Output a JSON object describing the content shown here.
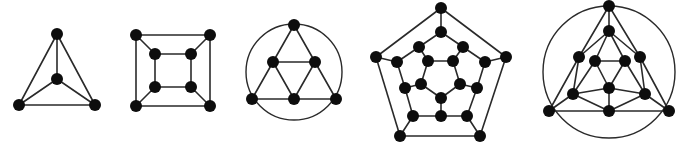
{
  "figure": {
    "node_color": "#0d0d0d",
    "edge_color": "#2a2a2a",
    "node_radius": 6
  },
  "graphs": [
    {
      "name": "tetrahedron",
      "nodes": [
        [
          57,
          34
        ],
        [
          57,
          79
        ],
        [
          19,
          105
        ],
        [
          95,
          105
        ]
      ],
      "edges": [
        [
          0,
          1
        ],
        [
          0,
          2
        ],
        [
          0,
          3
        ],
        [
          1,
          2
        ],
        [
          1,
          3
        ],
        [
          2,
          3
        ]
      ],
      "circles": []
    },
    {
      "name": "cube",
      "nodes": [
        [
          136,
          35
        ],
        [
          210,
          35
        ],
        [
          136,
          106
        ],
        [
          210,
          106
        ],
        [
          155,
          54
        ],
        [
          191,
          54
        ],
        [
          155,
          87
        ],
        [
          191,
          87
        ]
      ],
      "edges": [
        [
          0,
          1
        ],
        [
          1,
          3
        ],
        [
          3,
          2
        ],
        [
          2,
          0
        ],
        [
          4,
          5
        ],
        [
          5,
          7
        ],
        [
          7,
          6
        ],
        [
          6,
          4
        ],
        [
          0,
          4
        ],
        [
          1,
          5
        ],
        [
          2,
          6
        ],
        [
          3,
          7
        ]
      ],
      "circles": []
    },
    {
      "name": "octahedron",
      "nodes": [
        [
          294,
          25
        ],
        [
          273,
          62
        ],
        [
          315,
          62
        ],
        [
          252,
          99
        ],
        [
          294,
          99
        ],
        [
          336,
          99
        ]
      ],
      "edges": [
        [
          0,
          1
        ],
        [
          0,
          2
        ],
        [
          1,
          2
        ],
        [
          1,
          3
        ],
        [
          1,
          4
        ],
        [
          2,
          4
        ],
        [
          2,
          5
        ],
        [
          3,
          4
        ],
        [
          4,
          5
        ]
      ],
      "circles": [
        [
          294,
          72,
          48
        ]
      ]
    },
    {
      "name": "dodecahedron",
      "nodes": [
        [
          441,
          8
        ],
        [
          376,
          57
        ],
        [
          506,
          57
        ],
        [
          400,
          136
        ],
        [
          480,
          136
        ],
        [
          441,
          32
        ],
        [
          419,
          47
        ],
        [
          463,
          47
        ],
        [
          397,
          62
        ],
        [
          485,
          62
        ],
        [
          405,
          88
        ],
        [
          477,
          88
        ],
        [
          413,
          116
        ],
        [
          441,
          116
        ],
        [
          467,
          116
        ],
        [
          428,
          61
        ],
        [
          453,
          61
        ],
        [
          421,
          84
        ],
        [
          460,
          84
        ],
        [
          441,
          98
        ]
      ],
      "edges": [
        [
          0,
          1
        ],
        [
          1,
          3
        ],
        [
          3,
          4
        ],
        [
          4,
          2
        ],
        [
          2,
          0
        ],
        [
          0,
          5
        ],
        [
          1,
          8
        ],
        [
          2,
          9
        ],
        [
          3,
          12
        ],
        [
          4,
          14
        ],
        [
          5,
          6
        ],
        [
          6,
          8
        ],
        [
          8,
          10
        ],
        [
          10,
          12
        ],
        [
          12,
          13
        ],
        [
          13,
          14
        ],
        [
          14,
          11
        ],
        [
          11,
          9
        ],
        [
          9,
          7
        ],
        [
          7,
          5
        ],
        [
          6,
          15
        ],
        [
          7,
          16
        ],
        [
          10,
          17
        ],
        [
          11,
          18
        ],
        [
          13,
          19
        ],
        [
          15,
          16
        ],
        [
          16,
          18
        ],
        [
          18,
          19
        ],
        [
          19,
          17
        ],
        [
          17,
          15
        ]
      ],
      "circles": []
    },
    {
      "name": "icosahedron",
      "nodes": [
        [
          609,
          6
        ],
        [
          609,
          31
        ],
        [
          579,
          57
        ],
        [
          595,
          61
        ],
        [
          625,
          61
        ],
        [
          640,
          57
        ],
        [
          609,
          88
        ],
        [
          573,
          94
        ],
        [
          645,
          94
        ],
        [
          549,
          111
        ],
        [
          609,
          111
        ],
        [
          669,
          111
        ]
      ],
      "edges": [
        [
          0,
          1
        ],
        [
          0,
          2
        ],
        [
          0,
          5
        ],
        [
          2,
          9
        ],
        [
          5,
          11
        ],
        [
          1,
          2
        ],
        [
          1,
          3
        ],
        [
          1,
          4
        ],
        [
          1,
          5
        ],
        [
          3,
          4
        ],
        [
          2,
          7
        ],
        [
          3,
          7
        ],
        [
          3,
          6
        ],
        [
          4,
          6
        ],
        [
          4,
          8
        ],
        [
          5,
          8
        ],
        [
          6,
          7
        ],
        [
          6,
          8
        ],
        [
          6,
          10
        ],
        [
          7,
          9
        ],
        [
          7,
          10
        ],
        [
          8,
          10
        ],
        [
          8,
          11
        ],
        [
          9,
          10
        ],
        [
          10,
          11
        ]
      ],
      "circles": [
        [
          609,
          72,
          66
        ]
      ]
    }
  ]
}
